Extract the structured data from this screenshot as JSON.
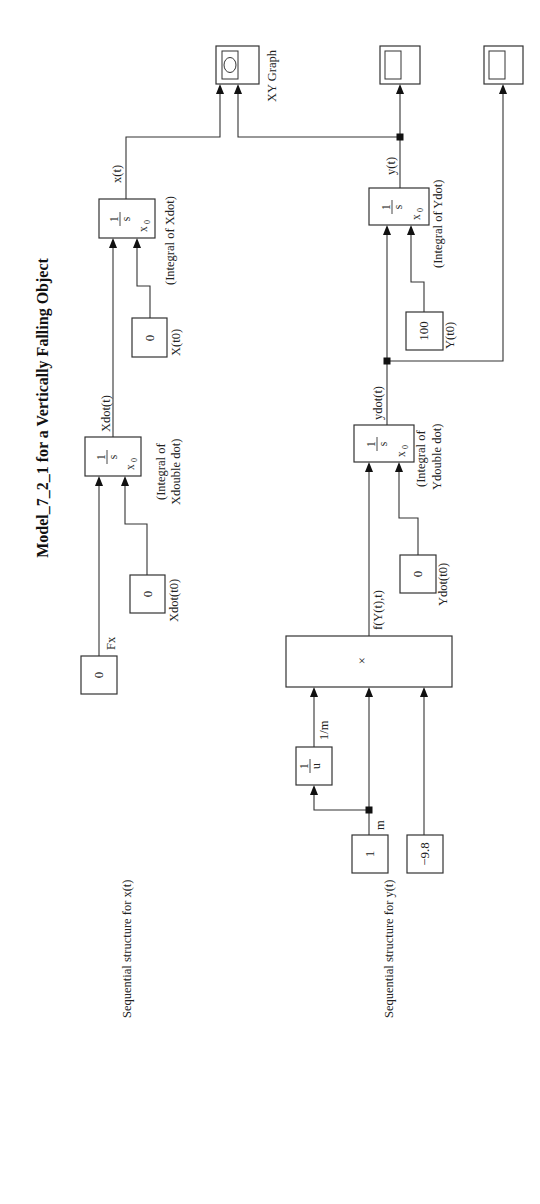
{
  "title": "Model_7_2_1 for a Vertically Falling Object",
  "section_labels": {
    "x_structure": "Sequential structure for x(t)",
    "y_structure": "Sequential structure for y(t)"
  },
  "x_chain": {
    "fx_const": {
      "value": "0",
      "label": "Fx"
    },
    "xdot0_const": {
      "value": "0",
      "label": "Xdot(t0)"
    },
    "xdot_integrator": {
      "num": "1",
      "den": "s",
      "ic": "x",
      "ic_sub": "0",
      "caption_line1": "(Integral of",
      "caption_line2": "Xdouble dot)",
      "out_signal": "Xdot(t)"
    },
    "x0_const": {
      "value": "0",
      "label": "X(t0)"
    },
    "x_integrator": {
      "num": "1",
      "den": "s",
      "ic": "x",
      "ic_sub": "0",
      "caption": "(Integral of Xdot)",
      "out_signal": "x(t)"
    }
  },
  "y_chain": {
    "mass_const": {
      "value": "1",
      "signal": "m"
    },
    "gravity_const": {
      "value": "−9.8"
    },
    "reciprocal": {
      "num": "1",
      "den": "u",
      "signal": "1/m"
    },
    "product": {
      "symbol": "×",
      "out_signal": "f(Y(t),t)"
    },
    "ydot0_const": {
      "value": "0",
      "label": "Ydot(t0)"
    },
    "ydot_integrator": {
      "num": "1",
      "den": "s",
      "ic": "x",
      "ic_sub": "0",
      "caption_line1": "(Integral of",
      "caption_line2": "Ydouble dot)",
      "out_signal": "ydot(t)"
    },
    "y0_const": {
      "value": "100",
      "label": "Y(t0)"
    },
    "y_integrator": {
      "num": "1",
      "den": "s",
      "ic": "x",
      "ic_sub": "0",
      "caption": "(Integral of Ydot)",
      "out_signal": "y(t)"
    }
  },
  "sinks": {
    "xy_graph": {
      "label": "XY Graph",
      "icon": "xy-graph-icon"
    },
    "scope_y": {
      "icon": "scope-icon"
    },
    "scope_ydot": {
      "icon": "scope-icon"
    }
  }
}
